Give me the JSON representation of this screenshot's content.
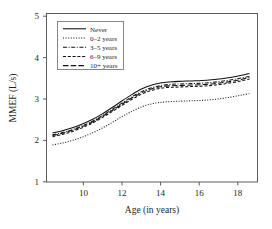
{
  "chart_data": {
    "type": "line",
    "title": "",
    "xlabel": "Age (in years)",
    "ylabel": "MMEF (L/s)",
    "xlim": [
      8.4,
      19.0
    ],
    "ylim": [
      0.75,
      5.25
    ],
    "xticks": [
      10,
      12,
      14,
      16,
      18
    ],
    "yticks": [
      1,
      2,
      3,
      4,
      5
    ],
    "xtick_labels": [
      "10",
      "12",
      "14",
      "16",
      "18"
    ],
    "ytick_labels": [
      "1",
      "2",
      "3",
      "4",
      "5"
    ],
    "grid": false,
    "legend_position": "upper left",
    "x": [
      8.7,
      9.2,
      9.7,
      10.2,
      10.7,
      11.2,
      11.7,
      12.2,
      12.7,
      13.2,
      13.7,
      14.2,
      14.7,
      15.2,
      15.7,
      16.2,
      16.7,
      17.2,
      17.7,
      18.2,
      18.6
    ],
    "series": [
      {
        "name": "Never",
        "style": "solid",
        "values": [
          2.06,
          2.12,
          2.2,
          2.3,
          2.42,
          2.57,
          2.74,
          2.92,
          3.09,
          3.24,
          3.34,
          3.4,
          3.43,
          3.44,
          3.45,
          3.46,
          3.48,
          3.51,
          3.55,
          3.6,
          3.65
        ]
      },
      {
        "name": "0–2 years",
        "style": "dotted",
        "values": [
          1.74,
          1.79,
          1.86,
          1.95,
          2.06,
          2.19,
          2.34,
          2.5,
          2.64,
          2.76,
          2.84,
          2.88,
          2.9,
          2.91,
          2.92,
          2.93,
          2.95,
          2.98,
          3.02,
          3.07,
          3.11
        ]
      },
      {
        "name": "3–5 years",
        "style": "dashdot",
        "values": [
          2.01,
          2.07,
          2.15,
          2.25,
          2.37,
          2.52,
          2.69,
          2.86,
          3.03,
          3.17,
          3.27,
          3.33,
          3.36,
          3.37,
          3.38,
          3.39,
          3.41,
          3.44,
          3.48,
          3.53,
          3.57
        ]
      },
      {
        "name": "6–9 years",
        "style": "dashed",
        "values": [
          1.96,
          2.02,
          2.1,
          2.2,
          2.32,
          2.47,
          2.63,
          2.8,
          2.96,
          3.1,
          3.2,
          3.26,
          3.28,
          3.29,
          3.3,
          3.31,
          3.33,
          3.36,
          3.4,
          3.45,
          3.5
        ]
      },
      {
        "name": "10+ years",
        "style": "longdash",
        "values": [
          1.99,
          2.05,
          2.13,
          2.23,
          2.35,
          2.5,
          2.66,
          2.83,
          3.0,
          3.14,
          3.24,
          3.3,
          3.32,
          3.33,
          3.34,
          3.35,
          3.37,
          3.4,
          3.44,
          3.49,
          3.54
        ]
      }
    ]
  },
  "legend": {
    "entries": [
      {
        "label": "Never"
      },
      {
        "label": "0–2 years"
      },
      {
        "label": "3–5 years"
      },
      {
        "label": "6–9 years"
      },
      {
        "label": "10+ years"
      }
    ]
  }
}
